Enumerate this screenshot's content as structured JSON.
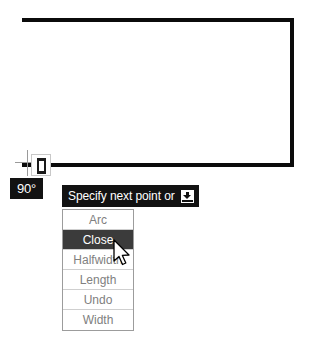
{
  "drawing": {
    "label": "polyline-preview",
    "line_color": "#0b0b0b",
    "segments": [
      {
        "name": "top-edge",
        "from": [
          22,
          20
        ],
        "to": [
          292,
          20
        ]
      },
      {
        "name": "right-edge",
        "from": [
          292,
          20
        ],
        "to": [
          292,
          165
        ]
      },
      {
        "name": "bottom-edge",
        "from": [
          292,
          165
        ],
        "to": [
          49,
          165
        ]
      },
      {
        "name": "rubber-band-stub",
        "from": [
          33,
          165
        ],
        "to": [
          22,
          165
        ]
      }
    ]
  },
  "osnap": {
    "marker_name": "endpoint-snap-marker",
    "glyph": "perpendicular-box"
  },
  "angle_tooltip": {
    "value": "90°"
  },
  "prompt": {
    "text": "Specify next point or",
    "expand_icon": "expand-options-icon"
  },
  "menu": {
    "name": "polyline-options-menu",
    "items": [
      {
        "label": "Arc",
        "selected": false
      },
      {
        "label": "Close",
        "selected": true
      },
      {
        "label": "Halfwidth",
        "selected": false
      },
      {
        "label": "Length",
        "selected": false
      },
      {
        "label": "Undo",
        "selected": false
      },
      {
        "label": "Width",
        "selected": false
      }
    ]
  },
  "cursor": {
    "name": "mouse-pointer",
    "x": 112,
    "y": 239
  },
  "colors": {
    "background": "#ffffff",
    "ink": "#0b0b0b",
    "tooltip_bg": "#121212",
    "tooltip_fg": "#ffffff",
    "menu_text": "#808080",
    "menu_border": "#9c9c9c",
    "menu_selected_bg": "#3b3b3b",
    "menu_selected_fg": "#ffffff"
  }
}
